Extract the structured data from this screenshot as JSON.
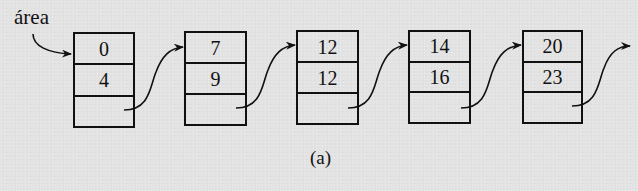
{
  "diagram": {
    "type": "linked-list",
    "head_label": "área",
    "caption": "(a)",
    "nodes": [
      {
        "index": 0,
        "field1": "0",
        "field2": "4",
        "pointer": ""
      },
      {
        "index": 1,
        "field1": "7",
        "field2": "9",
        "pointer": ""
      },
      {
        "index": 2,
        "field1": "12",
        "field2": "12",
        "pointer": ""
      },
      {
        "index": 3,
        "field1": "14",
        "field2": "16",
        "pointer": ""
      },
      {
        "index": 4,
        "field1": "20",
        "field2": "23",
        "pointer": ""
      }
    ],
    "edges": [
      {
        "from": "head",
        "to": "node-0"
      },
      {
        "from": "node-0",
        "to": "node-1"
      },
      {
        "from": "node-1",
        "to": "node-2"
      },
      {
        "from": "node-2",
        "to": "node-3"
      },
      {
        "from": "node-3",
        "to": "node-4"
      },
      {
        "from": "node-4",
        "to": "continues"
      }
    ],
    "colors": {
      "background": "#e3e3e3",
      "ink": "#111111"
    }
  }
}
